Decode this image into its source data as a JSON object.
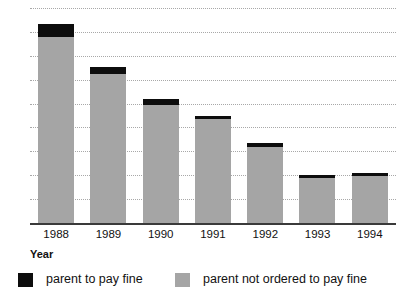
{
  "chart_data": {
    "type": "bar",
    "title": "",
    "xlabel": "Year",
    "ylabel": "",
    "stacked": true,
    "grid": true,
    "legend_position": "bottom",
    "ylim": [
      0,
      18
    ],
    "yticks": [
      0,
      2,
      4,
      6,
      8,
      10,
      12,
      14,
      16,
      18
    ],
    "ytick_labels": [
      "0",
      "2",
      "4",
      "6",
      "8",
      "10",
      "12",
      "14",
      "16",
      "18"
    ],
    "categories": [
      "1988",
      "1989",
      "1990",
      "1991",
      "1992",
      "1993",
      "1994"
    ],
    "series": [
      {
        "name": "parent not ordered to pay fine",
        "color": "#a5a5a5",
        "values": [
          15.6,
          12.5,
          9.9,
          8.7,
          6.4,
          3.8,
          3.9
        ]
      },
      {
        "name": "parent to pay fine",
        "color": "#0d0d0d",
        "values": [
          1.1,
          0.6,
          0.5,
          0.3,
          0.3,
          0.2,
          0.3
        ]
      }
    ],
    "totals": [
      16.7,
      13.1,
      10.4,
      9.0,
      6.7,
      4.0,
      4.2
    ]
  },
  "legend": {
    "items": [
      {
        "label": "parent to pay fine",
        "swatch": "black"
      },
      {
        "label": "parent not ordered to pay fine",
        "swatch": "gray"
      }
    ]
  },
  "axis": {
    "x_title": "Year"
  },
  "clipped_title": ""
}
